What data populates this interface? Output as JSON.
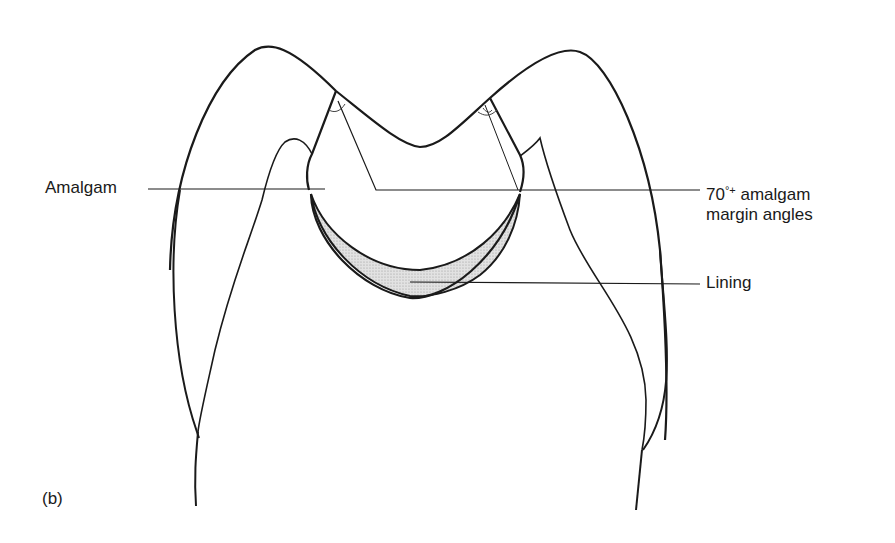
{
  "figure": {
    "panel_label": "(b)"
  },
  "labels": {
    "amalgam": "Amalgam",
    "margin_angles_value": "70",
    "margin_angles_sup": "°+",
    "margin_angles_rest": " amalgam",
    "margin_angles_line2": "margin angles",
    "lining": "Lining"
  },
  "colors": {
    "stroke": "#1a1a1a",
    "lining_fill": "#d9d9d9",
    "background": "#ffffff"
  }
}
